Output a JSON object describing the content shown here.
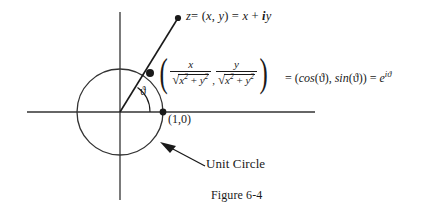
{
  "figure": {
    "caption": "Figure 6-4",
    "unit_circle_label": "Unit Circle",
    "point_label": "(1,0)",
    "theta_symbol": "ϑ",
    "stroke_color": "#333333",
    "text_color": "#1a1a1a",
    "background_color": "#ffffff"
  },
  "z_label": {
    "variable": "z",
    "equals_1": "= (",
    "x": "x",
    "comma": ", ",
    "y": "y",
    "close_equals": ") = ",
    "x2": "x",
    "plus": " + ",
    "i": "i",
    "y2": "y"
  },
  "coordinate_expression": {
    "open_paren": "(",
    "close_paren": ")",
    "comma": ",",
    "first_numerator": "x",
    "first_denominator_radicand": "x",
    "first_denominator_exp": "2",
    "first_denominator_plus": " + ",
    "first_denominator_radicand2": "y",
    "first_denominator_exp2": "2",
    "second_numerator": "y",
    "second_denominator_radicand": "x",
    "second_denominator_exp": "2",
    "second_denominator_plus": " + ",
    "second_denominator_radicand2": "y",
    "second_denominator_exp2": "2",
    "radical_glyph": "√"
  },
  "right_hand_side": {
    "equals_1": "= (",
    "cos": "cos",
    "cos_arg": "(ϑ)",
    "comma": ", ",
    "sin": "sin",
    "sin_arg": "(ϑ)",
    "close": ") = ",
    "e": "e",
    "exponent": "iϑ"
  },
  "geometry": {
    "origin_x": 120,
    "origin_y": 112,
    "circle_radius": 43,
    "x_axis_start": 27,
    "x_axis_end": 315,
    "y_axis_start": 12,
    "y_axis_end": 200,
    "point_on_circle_x": 150,
    "point_on_circle_y": 73,
    "z_point_x": 178,
    "z_point_y": 18,
    "unit_point_x": 163,
    "unit_point_y": 112,
    "arrow_tail_x": 205,
    "arrow_tail_y": 166,
    "arrow_head_x": 163,
    "arrow_head_y": 144
  }
}
